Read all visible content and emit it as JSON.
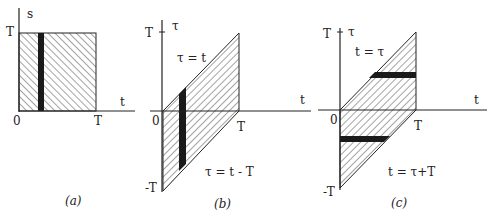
{
  "panels": {
    "a": {
      "caption": "(a)",
      "y_axis_label": "s",
      "x_axis_label": "t",
      "origin": "0",
      "y_tick": "T",
      "x_tick": "T"
    },
    "b": {
      "caption": "(b)",
      "y_axis_label": "τ",
      "x_axis_label": "t",
      "origin": "0",
      "y_tick_top": "T",
      "y_tick_bottom": "-T",
      "x_tick": "T",
      "upper_line_label": "τ = t",
      "lower_line_label": "τ = t - T"
    },
    "c": {
      "caption": "(c)",
      "y_axis_label": "τ",
      "x_axis_label": "t",
      "origin": "0",
      "y_tick_top": "T",
      "y_tick_bottom": "-T",
      "x_tick": "T",
      "upper_line_label": "t = τ",
      "lower_line_label": "t = τ+T"
    }
  },
  "colors": {
    "ink": "#222222",
    "strip": "#1a1a1a",
    "background": "#ffffff"
  }
}
